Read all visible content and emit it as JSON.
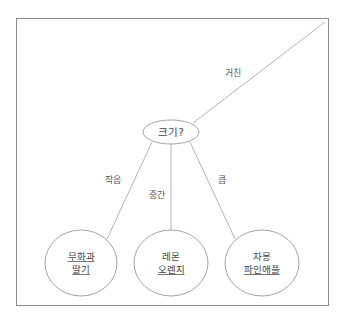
{
  "diagram": {
    "root": {
      "label": "크기?"
    },
    "edges": [
      {
        "label": "거친",
        "target": "outside"
      },
      {
        "label": "작음",
        "target": "leaf-0"
      },
      {
        "label": "중간",
        "target": "leaf-1"
      },
      {
        "label": "큼",
        "target": "leaf-2"
      }
    ],
    "leaves": [
      {
        "line1": "무화과",
        "line2": "딸기",
        "line1_underlined": true,
        "line2_underlined": true
      },
      {
        "line1": "레몬",
        "line2": "오렌지",
        "line1_underlined": false,
        "line2_underlined": true
      },
      {
        "line1": "자몽",
        "line2": "파인애플",
        "line1_underlined": false,
        "line2_underlined": true
      }
    ]
  },
  "colors": {
    "stroke": "#9a9a9a",
    "frame": "#8c8c8c",
    "text": "#444444"
  }
}
